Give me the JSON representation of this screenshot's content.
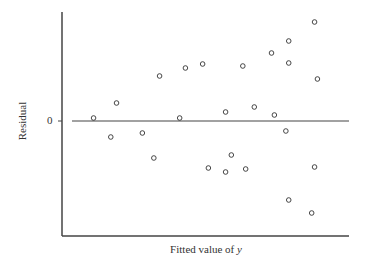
{
  "chart_data": {
    "type": "scatter",
    "title": "",
    "xlabel": "Fitted value of y",
    "xlabel_parts": {
      "text": "Fitted value of ",
      "italic": "y"
    },
    "ylabel": "Residual",
    "y_tick_labels": [
      "0"
    ],
    "reference_line": {
      "y": 0,
      "label": "0"
    },
    "grid": false,
    "legend": null,
    "marker": "open-circle",
    "xlim": [
      0,
      100
    ],
    "ylim": [
      -115,
      110
    ],
    "points": [
      {
        "x": 11,
        "y": 3
      },
      {
        "x": 17,
        "y": -16
      },
      {
        "x": 19,
        "y": 18
      },
      {
        "x": 28,
        "y": -12
      },
      {
        "x": 32,
        "y": -37
      },
      {
        "x": 34,
        "y": 45
      },
      {
        "x": 41,
        "y": 3
      },
      {
        "x": 43,
        "y": 53
      },
      {
        "x": 49,
        "y": 57
      },
      {
        "x": 51,
        "y": -47
      },
      {
        "x": 57,
        "y": 9
      },
      {
        "x": 57,
        "y": -51
      },
      {
        "x": 59,
        "y": -34
      },
      {
        "x": 63,
        "y": 55
      },
      {
        "x": 64,
        "y": -48
      },
      {
        "x": 67,
        "y": 14
      },
      {
        "x": 73,
        "y": 68
      },
      {
        "x": 74,
        "y": 6
      },
      {
        "x": 79,
        "y": 80
      },
      {
        "x": 79,
        "y": 58
      },
      {
        "x": 78,
        "y": -10
      },
      {
        "x": 79,
        "y": -79
      },
      {
        "x": 88,
        "y": 99
      },
      {
        "x": 89,
        "y": 42
      },
      {
        "x": 88,
        "y": -46
      },
      {
        "x": 87,
        "y": -92
      }
    ]
  },
  "axes": {
    "x_axis_label": "Fitted value of ",
    "x_axis_label_italic": "y",
    "y_axis_label": "Residual",
    "zero_tick_label": "0"
  }
}
